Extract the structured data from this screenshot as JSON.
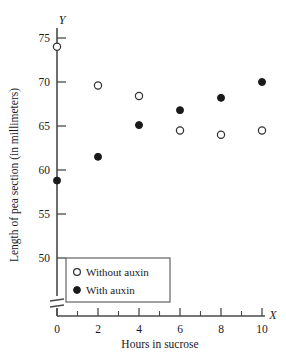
{
  "chart_data": {
    "type": "scatter",
    "title": "",
    "xlabel": "Hours in sucrose",
    "ylabel": "Length of pea section (in millimeters)",
    "x_axis_name": "X",
    "y_axis_name": "Y",
    "xlim": [
      0,
      10
    ],
    "ylim": [
      47,
      77
    ],
    "y_axis_break": true,
    "grid": false,
    "legend_position": "lower-left",
    "x_ticks": [
      0,
      2,
      4,
      6,
      8,
      10
    ],
    "x_tick_labels": [
      "0",
      "2",
      "4",
      "6",
      "8",
      "10"
    ],
    "x_minor_ticks": [
      1,
      3,
      5,
      7,
      9
    ],
    "y_ticks": [
      50,
      55,
      60,
      65,
      70,
      75
    ],
    "y_tick_labels": [
      "50",
      "55",
      "60",
      "65",
      "70",
      "75"
    ],
    "x": [
      0,
      2,
      4,
      6,
      8,
      10
    ],
    "series": [
      {
        "name": "Without auxin",
        "marker": "open-circle",
        "color": "#333333",
        "values": [
          74.0,
          69.6,
          68.4,
          64.5,
          64.0,
          64.5
        ]
      },
      {
        "name": "With auxin",
        "marker": "filled-circle",
        "color": "#1a1a1a",
        "values": [
          58.8,
          61.5,
          65.1,
          66.8,
          68.2,
          70.0
        ]
      }
    ]
  },
  "legend": {
    "entries": [
      {
        "label": "Without auxin",
        "marker": "open-circle"
      },
      {
        "label": "With auxin",
        "marker": "filled-circle"
      }
    ]
  }
}
